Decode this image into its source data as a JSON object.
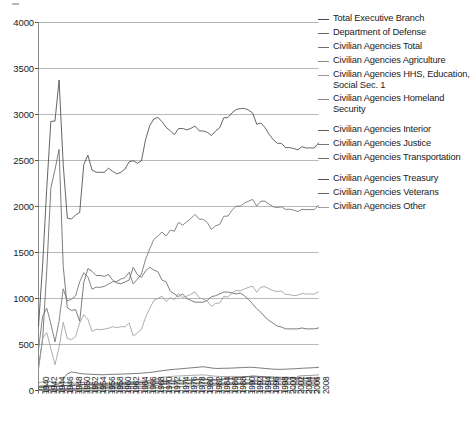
{
  "chart_data": {
    "type": "line",
    "title": "",
    "xlabel": "",
    "ylabel": "",
    "ylim": [
      0,
      4000
    ],
    "yticks": [
      0,
      500,
      1000,
      1500,
      2000,
      2500,
      3000,
      3500,
      4000
    ],
    "grid": true,
    "legend_position": "right",
    "x": [
      1940,
      1941,
      1942,
      1943,
      1944,
      1945,
      1946,
      1947,
      1948,
      1949,
      1950,
      1951,
      1952,
      1953,
      1954,
      1955,
      1956,
      1957,
      1958,
      1959,
      1960,
      1961,
      1962,
      1963,
      1964,
      1965,
      1966,
      1967,
      1968,
      1969,
      1970,
      1971,
      1972,
      1973,
      1974,
      1975,
      1976,
      1977,
      1978,
      1979,
      1980,
      1981,
      1982,
      1983,
      1984,
      1985,
      1986,
      1987,
      1988,
      1989,
      1990,
      1991,
      1992,
      1993,
      1994,
      1995,
      1996,
      1997,
      1998,
      1999,
      2000,
      2001,
      2002,
      2003,
      2004,
      2005,
      2006,
      2007,
      2008
    ],
    "xtick_labels": [
      "1940",
      "1942",
      "1944",
      "1946",
      "1948",
      "1950",
      "1952",
      "1954",
      "1956",
      "1958",
      "1960",
      "1962",
      "1964",
      "1966",
      "1968",
      "1970",
      "1972",
      "1974",
      "1976",
      "1978",
      "1980",
      "1982",
      "1984",
      "1986",
      "1988",
      "1990",
      "1992",
      "1994",
      "1996",
      "1998",
      "2000",
      "2002",
      "2004",
      "2006",
      "2008"
    ],
    "series": [
      {
        "name": "Total Executive Branch",
        "color": "#4a4a4a",
        "values": [
          699,
          1363,
          2196,
          2926,
          2928,
          3374,
          2455,
          1873,
          1863,
          1908,
          1934,
          2456,
          2558,
          2396,
          2373,
          2371,
          2372,
          2417,
          2382,
          2355,
          2371,
          2407,
          2485,
          2498,
          2470,
          2496,
          2726,
          2877,
          2951,
          2969,
          2922,
          2860,
          2823,
          2782,
          2847,
          2848,
          2833,
          2849,
          2875,
          2823,
          2821,
          2806,
          2770,
          2820,
          2855,
          2964,
          2966,
          3019,
          3054,
          3064,
          3067,
          3048,
          3017,
          2894,
          2908,
          2858,
          2786,
          2727,
          2687,
          2687,
          2639,
          2640,
          2630,
          2616,
          2650,
          2636,
          2637,
          2636,
          2692
        ]
      },
      {
        "name": "Department of Defense",
        "color": "#666666",
        "values": [
          256,
          556,
          1300,
          2200,
          2400,
          2620,
          1350,
          900,
          870,
          880,
          753,
          1175,
          1325,
          1295,
          1250,
          1250,
          1240,
          1260,
          1200,
          1170,
          1160,
          1180,
          1200,
          1340,
          1260,
          1230,
          1300,
          1340,
          1310,
          1290,
          1200,
          1180,
          1080,
          1050,
          1020,
          1050,
          1000,
          980,
          960,
          960,
          960,
          980,
          1020,
          1030,
          1050,
          1070,
          1070,
          1060,
          1050,
          1060,
          1030,
          990,
          940,
          890,
          850,
          800,
          760,
          730,
          700,
          690,
          670,
          670,
          670,
          670,
          680,
          670,
          670,
          670,
          680
        ]
      },
      {
        "name": "Civilian Agencies Total",
        "color": "#707070",
        "values": [
          443,
          807,
          896,
          726,
          528,
          754,
          1105,
          973,
          993,
          1028,
          1181,
          1281,
          1233,
          1101,
          1123,
          1121,
          1132,
          1157,
          1182,
          1185,
          1211,
          1227,
          1285,
          1158,
          1210,
          1266,
          1426,
          1537,
          1641,
          1679,
          1722,
          1680,
          1743,
          1732,
          1827,
          1798,
          1833,
          1869,
          1915,
          1863,
          1861,
          1826,
          1750,
          1790,
          1805,
          1894,
          1896,
          1959,
          2004,
          2004,
          2037,
          2058,
          2077,
          2004,
          2058,
          2058,
          2026,
          1997,
          1987,
          1997,
          1969,
          1970,
          1960,
          1946,
          1970,
          1966,
          1967,
          1966,
          2012
        ]
      },
      {
        "name": "Civilian Agencies Agriculture",
        "color": "#8a8a8a",
        "values": [
          82,
          96,
          110,
          95,
          78,
          80,
          85,
          82,
          79,
          80,
          84,
          88,
          85,
          82,
          80,
          78,
          78,
          80,
          82,
          85,
          88,
          90,
          92,
          95,
          98,
          103,
          107,
          110,
          112,
          113,
          110,
          108,
          105,
          105,
          108,
          110,
          112,
          112,
          114,
          116,
          118,
          115,
          110,
          108,
          110,
          118,
          120,
          122,
          122,
          120,
          118,
          115,
          112,
          108,
          105,
          105,
          100,
          98,
          97,
          96,
          95,
          95,
          94,
          93,
          93,
          92,
          92,
          92,
          94
        ]
      },
      {
        "name": "Civilian Agencies HHS, Education, Social Sec. 1",
        "color": "#9a9a9a",
        "values": [
          5,
          6,
          7,
          8,
          9,
          11,
          14,
          16,
          18,
          20,
          23,
          26,
          29,
          32,
          35,
          38,
          42,
          45,
          48,
          52,
          58,
          63,
          68,
          74,
          80,
          88,
          98,
          110,
          122,
          132,
          142,
          148,
          152,
          155,
          158,
          160,
          162,
          164,
          166,
          168,
          170,
          166,
          160,
          155,
          152,
          152,
          152,
          153,
          153,
          152,
          152,
          152,
          151,
          147,
          143,
          140,
          136,
          132,
          130,
          128,
          127,
          127,
          128,
          130,
          133,
          135,
          137,
          138,
          140
        ]
      },
      {
        "name": "Civilian Agencies Homeland Security",
        "color": "#888888",
        "values": [
          0,
          0,
          0,
          0,
          0,
          0,
          0,
          0,
          0,
          0,
          0,
          0,
          0,
          0,
          0,
          0,
          0,
          0,
          0,
          0,
          0,
          0,
          0,
          0,
          0,
          0,
          0,
          0,
          0,
          0,
          0,
          0,
          0,
          0,
          0,
          0,
          0,
          0,
          0,
          0,
          0,
          0,
          0,
          0,
          0,
          0,
          0,
          0,
          0,
          0,
          0,
          0,
          0,
          0,
          0,
          0,
          0,
          0,
          0,
          0,
          0,
          0,
          0,
          156,
          160,
          162,
          164,
          166,
          170
        ]
      },
      {
        "name": "Civilian Agencies Interior",
        "color": "#5c5c5c",
        "values": [
          46,
          50,
          54,
          50,
          45,
          48,
          52,
          54,
          55,
          56,
          58,
          60,
          60,
          58,
          57,
          57,
          57,
          58,
          59,
          60,
          61,
          62,
          64,
          65,
          66,
          68,
          70,
          72,
          74,
          76,
          78,
          78,
          78,
          78,
          80,
          80,
          80,
          82,
          82,
          83,
          84,
          83,
          80,
          78,
          78,
          80,
          80,
          80,
          80,
          79,
          78,
          77,
          76,
          74,
          73,
          72,
          70,
          70,
          70,
          70,
          70,
          70,
          70,
          70,
          71,
          71,
          71,
          71,
          72
        ]
      },
      {
        "name": "Civilian Agencies Justice",
        "color": "#757575",
        "values": [
          10,
          11,
          12,
          13,
          13,
          14,
          15,
          15,
          16,
          16,
          17,
          18,
          18,
          18,
          18,
          18,
          18,
          19,
          19,
          20,
          20,
          21,
          22,
          23,
          24,
          25,
          26,
          27,
          28,
          29,
          30,
          32,
          34,
          36,
          39,
          42,
          45,
          48,
          50,
          52,
          54,
          54,
          54,
          56,
          58,
          60,
          63,
          66,
          70,
          74,
          80,
          88,
          95,
          98,
          100,
          102,
          104,
          108,
          112,
          118,
          125,
          128,
          130,
          105,
          106,
          107,
          108,
          106,
          108
        ]
      },
      {
        "name": "Civilian Agencies Transportation",
        "color": "#6e6e6e",
        "values": [
          8,
          9,
          10,
          11,
          11,
          12,
          13,
          14,
          15,
          16,
          18,
          20,
          22,
          24,
          26,
          28,
          30,
          32,
          34,
          36,
          38,
          40,
          42,
          44,
          46,
          48,
          50,
          52,
          54,
          56,
          65,
          68,
          70,
          70,
          70,
          70,
          71,
          72,
          72,
          72,
          73,
          72,
          70,
          68,
          67,
          67,
          66,
          66,
          66,
          66,
          67,
          68,
          68,
          66,
          65,
          64,
          63,
          62,
          62,
          62,
          64,
          64,
          64,
          62,
          57,
          56,
          55,
          55,
          56
        ]
      },
      {
        "name": "Civilian Agencies Treasury",
        "color": "#4f4f4f",
        "values": [
          28,
          32,
          38,
          42,
          44,
          48,
          54,
          56,
          58,
          60,
          62,
          66,
          68,
          68,
          68,
          68,
          69,
          70,
          72,
          73,
          75,
          78,
          80,
          82,
          84,
          86,
          88,
          90,
          92,
          94,
          96,
          98,
          100,
          102,
          104,
          106,
          110,
          112,
          116,
          120,
          124,
          122,
          118,
          118,
          120,
          124,
          128,
          132,
          138,
          142,
          148,
          152,
          158,
          155,
          152,
          150,
          148,
          146,
          144,
          143,
          143,
          143,
          140,
          135,
          132,
          130,
          128,
          128,
          130
        ]
      },
      {
        "name": "Civilian Agencies Veterans",
        "color": "#636363",
        "values": [
          40,
          42,
          46,
          52,
          58,
          72,
          130,
          180,
          200,
          195,
          185,
          180,
          178,
          176,
          174,
          172,
          172,
          174,
          176,
          177,
          178,
          180,
          182,
          184,
          186,
          188,
          192,
          196,
          202,
          208,
          215,
          220,
          226,
          230,
          234,
          238,
          242,
          246,
          250,
          254,
          258,
          252,
          245,
          240,
          240,
          242,
          242,
          244,
          246,
          248,
          250,
          252,
          252,
          248,
          244,
          240,
          236,
          232,
          230,
          230,
          232,
          234,
          236,
          238,
          242,
          244,
          246,
          248,
          252
        ]
      },
      {
        "name": "Civilian Agencies Other",
        "color": "#9e9e9e",
        "values": [
          224,
          566,
          629,
          455,
          280,
          469,
          742,
          566,
          552,
          585,
          734,
          823,
          773,
          643,
          665,
          662,
          666,
          677,
          694,
          682,
          694,
          693,
          735,
          591,
          626,
          664,
          795,
          891,
          977,
          1001,
          1026,
          968,
          1010,
          988,
          1054,
          1012,
          1025,
          1045,
          1073,
          1008,
          994,
          972,
          913,
          947,
          951,
          1022,
          1015,
          1063,
          1087,
          1082,
          1104,
          1121,
          1134,
          1068,
          1125,
          1128,
          1105,
          1085,
          1077,
          1080,
          1046,
          1041,
          1031,
          1037,
          1054,
          1049,
          1049,
          1047,
          1072
        ]
      }
    ]
  },
  "axes": {
    "y_tick_labels": [
      "4000",
      "3500",
      "3000",
      "2500",
      "2000",
      "1500",
      "1000",
      "500",
      "0"
    ],
    "x_tick_labels": [
      "1940",
      "1942",
      "1944",
      "1946",
      "1948",
      "1950",
      "1952",
      "1954",
      "1956",
      "1958",
      "1960",
      "1962",
      "1964",
      "1966",
      "1968",
      "1970",
      "1972",
      "1974",
      "1976",
      "1978",
      "1980",
      "1982",
      "1984",
      "1986",
      "1988",
      "1990",
      "1992",
      "1994",
      "1996",
      "1998",
      "2000",
      "2002",
      "2004",
      "2006",
      "2008"
    ]
  },
  "legend": {
    "items": [
      {
        "label": "Total Executive Branch",
        "color": "#4a4a4a",
        "gap_after": false
      },
      {
        "label": "Department of Defense",
        "color": "#666666",
        "gap_after": false
      },
      {
        "label": "Civilian Agencies Total",
        "color": "#707070",
        "gap_after": false
      },
      {
        "label": "Civilian Agencies Agriculture",
        "color": "#8a8a8a",
        "gap_after": false
      },
      {
        "label": "Civilian Agencies HHS, Education, Social Sec. 1",
        "color": "#9a9a9a",
        "gap_after": false
      },
      {
        "label": "Civilian Agencies Homeland Security",
        "color": "#888888",
        "gap_after": true
      },
      {
        "label": "Civilian Agencies Interior",
        "color": "#5c5c5c",
        "gap_after": false
      },
      {
        "label": "Civilian Agencies Justice",
        "color": "#757575",
        "gap_after": false
      },
      {
        "label": "Civilian Agencies Transportation",
        "color": "#6e6e6e",
        "gap_after": true
      },
      {
        "label": "Civilian Agencies Treasury",
        "color": "#4f4f4f",
        "gap_after": false
      },
      {
        "label": "Civilian Agencies Veterans",
        "color": "#636363",
        "gap_after": false
      },
      {
        "label": "Civilian Agencies Other",
        "color": "#9e9e9e",
        "gap_after": false
      }
    ]
  },
  "style": {
    "grid_color": "#b0b0b0",
    "axis_color": "#8c8c8c",
    "background": "#ffffff"
  }
}
